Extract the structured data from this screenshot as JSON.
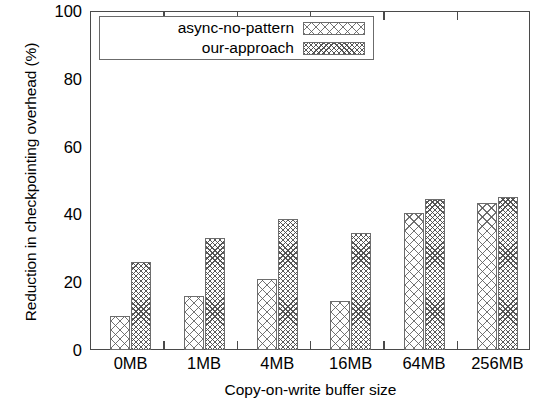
{
  "chart_data": {
    "type": "bar",
    "title": "",
    "xlabel": "Copy-on-write buffer size",
    "ylabel": "Reduction in checkpointing overhead (%)",
    "categories": [
      "0MB",
      "1MB",
      "4MB",
      "16MB",
      "64MB",
      "256MB"
    ],
    "series": [
      {
        "name": "async-no-pattern",
        "pattern": "coarse-crosshatch",
        "values": [
          10,
          16,
          21,
          14.5,
          40.5,
          43.5
        ]
      },
      {
        "name": "our-approach",
        "pattern": "fine-crosshatch",
        "values": [
          26,
          33,
          38.5,
          34.5,
          44.5,
          45
        ]
      }
    ],
    "ylim": [
      0,
      100
    ],
    "yticks": [
      0,
      20,
      40,
      60,
      80,
      100
    ],
    "ytick_labels": [
      "0",
      "20",
      "40",
      "60",
      "80",
      "100"
    ],
    "grid": false,
    "legend_position": "top-left",
    "frame_color": "#4a4a4a",
    "bar_edge_color": "#6d6d6d",
    "background": "#ffffff"
  },
  "legend": {
    "entries": [
      {
        "label": "async-no-pattern"
      },
      {
        "label": "our-approach"
      }
    ]
  }
}
